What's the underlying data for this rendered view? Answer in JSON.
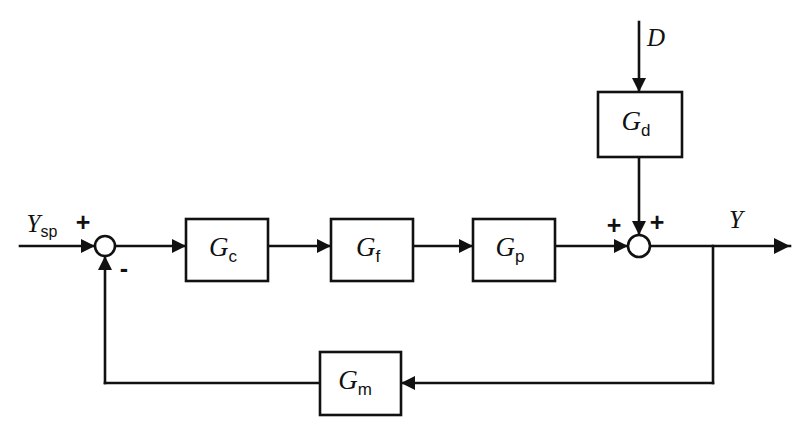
{
  "diagram": {
    "type": "block-diagram",
    "background_color": "#ffffff",
    "line_color": "#111111",
    "canvas": {
      "width": 807,
      "height": 436
    },
    "blocks": [
      {
        "id": "controller",
        "symbol": "G",
        "subscript": "c",
        "label": "Gc",
        "x": 186,
        "y": 219,
        "width": 82,
        "height": 62
      },
      {
        "id": "final-element",
        "symbol": "G",
        "subscript": "f",
        "label": "Gf",
        "x": 331,
        "y": 219,
        "width": 82,
        "height": 62
      },
      {
        "id": "process",
        "symbol": "G",
        "subscript": "p",
        "label": "Gp",
        "x": 473,
        "y": 219,
        "width": 82,
        "height": 62
      },
      {
        "id": "disturbance",
        "symbol": "G",
        "subscript": "d",
        "label": "Gd",
        "x": 598,
        "y": 92,
        "width": 84,
        "height": 65
      },
      {
        "id": "measurement",
        "symbol": "G",
        "subscript": "m",
        "label": "Gm",
        "x": 320,
        "y": 352,
        "width": 81,
        "height": 63
      }
    ],
    "junctions": [
      {
        "id": "error-junction",
        "x": 105,
        "y": 246,
        "radius": 10,
        "signs": [
          {
            "label": "+",
            "x": 83,
            "y": 224
          },
          {
            "label": "-",
            "x": 124,
            "y": 270
          }
        ]
      },
      {
        "id": "output-junction",
        "x": 639,
        "y": 246,
        "radius": 11,
        "signs": [
          {
            "label": "+",
            "x": 614,
            "y": 227
          },
          {
            "label": "+",
            "x": 657,
            "y": 224
          }
        ]
      }
    ],
    "signals": [
      {
        "id": "setpoint-input",
        "symbol": "Y",
        "subscript": "sp",
        "label": "Ysp",
        "x": 42,
        "y": 226
      },
      {
        "id": "disturbance-input",
        "symbol": "D",
        "subscript": "",
        "label": "D",
        "x": 656,
        "y": 40
      },
      {
        "id": "controlled-output",
        "symbol": "Y",
        "subscript": "",
        "label": "Y",
        "x": 736,
        "y": 222
      }
    ],
    "paths": {
      "setpoint_entry": "M 20 246 L 95 246",
      "error_to_gc": "M 115 246 L 186 246",
      "gc_to_gf": "M 268 246 L 331 246",
      "gf_to_gp": "M 413 246 L 473 246",
      "gp_to_sum": "M 555 246 L 628 246",
      "disturbance_entry": "M 639 22 L 639 92",
      "gd_to_sum": "M 639 157 L 639 235",
      "sum_to_output": "M 650 246 L 790 246",
      "output_branch_down": "M 713 246 L 713 383",
      "branch_to_gm": "M 713 383 L 401 383",
      "gm_to_riser": "M 320 383 L 105 383",
      "riser_to_junction": "M 105 383 L 105 256"
    },
    "arrowheads": [
      {
        "id": "setpoint-arrow",
        "x": 95,
        "y": 246,
        "direction": "right"
      },
      {
        "id": "gc-input-arrow",
        "x": 186,
        "y": 246,
        "direction": "right"
      },
      {
        "id": "gf-input-arrow",
        "x": 331,
        "y": 246,
        "direction": "right"
      },
      {
        "id": "gp-input-arrow",
        "x": 473,
        "y": 246,
        "direction": "right"
      },
      {
        "id": "sum-input-arrow",
        "x": 628,
        "y": 246,
        "direction": "right"
      },
      {
        "id": "gd-input-arrow",
        "x": 639,
        "y": 92,
        "direction": "down"
      },
      {
        "id": "sum-top-arrow",
        "x": 639,
        "y": 235,
        "direction": "down"
      },
      {
        "id": "output-arrow",
        "x": 790,
        "y": 246,
        "direction": "right"
      },
      {
        "id": "gm-input-arrow",
        "x": 401,
        "y": 383,
        "direction": "left"
      },
      {
        "id": "feedback-arrow",
        "x": 105,
        "y": 256,
        "direction": "up"
      }
    ]
  }
}
